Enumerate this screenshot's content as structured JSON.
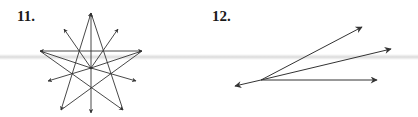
{
  "figures": [
    {
      "label": "11.",
      "description": "pentagram with rays from center",
      "color": "#333333"
    },
    {
      "label": "12.",
      "description": "four rays from a common vertex",
      "color": "#333333"
    }
  ]
}
